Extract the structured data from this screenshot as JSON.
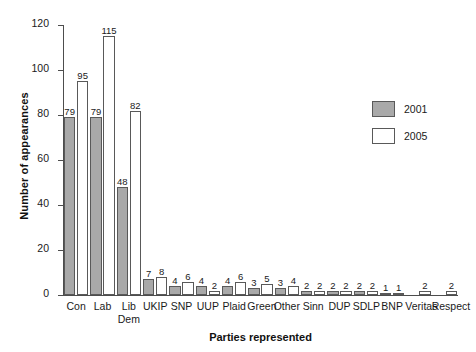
{
  "chart_data": {
    "type": "bar",
    "title": "",
    "xlabel": "Parties represented",
    "ylabel": "Number of appearances",
    "ylim": [
      0,
      120
    ],
    "yticks": [
      0,
      20,
      40,
      60,
      80,
      100,
      120
    ],
    "grid": false,
    "legend_position": "right",
    "categories": [
      "Con",
      "Lab",
      "Lib Dem",
      "UKIP",
      "SNP",
      "UUP",
      "Plaid",
      "Green",
      "Other",
      "Sinn",
      "DUP",
      "SDLP",
      "BNP",
      "Veritas",
      "Respect"
    ],
    "category_lines": [
      [
        "Con"
      ],
      [
        "Lab"
      ],
      [
        "Lib",
        "Dem"
      ],
      [
        "UKIP"
      ],
      [
        "SNP"
      ],
      [
        "UUP"
      ],
      [
        "Plaid"
      ],
      [
        "Green"
      ],
      [
        "Other"
      ],
      [
        "Sinn"
      ],
      [
        "DUP"
      ],
      [
        "SDLP"
      ],
      [
        "BNP"
      ],
      [
        "Veritas"
      ],
      [
        "Respect"
      ]
    ],
    "series": [
      {
        "name": "2001",
        "color": "#a9a9a9",
        "values": [
          79,
          79,
          48,
          7,
          4,
          4,
          4,
          3,
          3,
          2,
          2,
          2,
          1,
          null,
          null
        ]
      },
      {
        "name": "2005",
        "color": "#ffffff",
        "values": [
          95,
          115,
          82,
          8,
          6,
          2,
          6,
          5,
          4,
          2,
          2,
          2,
          1,
          2,
          2
        ]
      }
    ]
  },
  "legend": {
    "items": [
      {
        "label": "2001",
        "swatch": "filled-gray"
      },
      {
        "label": "2005",
        "swatch": "outline-white"
      }
    ]
  },
  "axis": {
    "y_title": "Number of appearances",
    "x_title": "Parties represented",
    "y_tick_labels": [
      "0",
      "20",
      "40",
      "60",
      "80",
      "100",
      "120"
    ]
  },
  "colors": {
    "series_2001": "#a9a9a9",
    "series_2005": "#ffffff",
    "bar_border": "#595959",
    "axis": "#4d4d4d",
    "text": "#1a1a1a",
    "background": "#ffffff"
  }
}
